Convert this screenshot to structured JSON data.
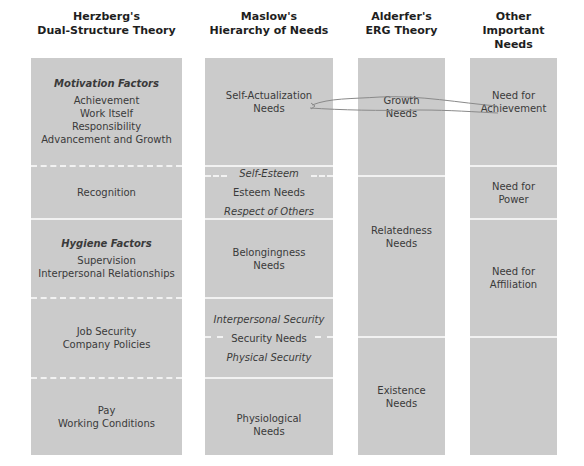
{
  "headers": {
    "herzberg": [
      "Herzberg's",
      "Dual-Structure Theory"
    ],
    "maslow": [
      "Maslow's",
      "Hierarchy of Needs"
    ],
    "alderfer": [
      "Alderfer's",
      "ERG Theory"
    ],
    "other": [
      "Other",
      "Important Needs"
    ]
  },
  "herzberg": {
    "motivation_heading": "Motivation Factors",
    "motivation_items": [
      "Achievement",
      "Work Itself",
      "Responsibility",
      "Advancement and Growth"
    ],
    "recognition": "Recognition",
    "hygiene_heading": "Hygiene Factors",
    "hygiene_items_1": [
      "Supervision",
      "Interpersonal Relationships"
    ],
    "hygiene_items_2": [
      "Job Security",
      "Company Policies"
    ],
    "hygiene_items_3": [
      "Pay",
      "Working Conditions"
    ]
  },
  "maslow": {
    "self_actualization": [
      "Self-Actualization",
      "Needs"
    ],
    "esteem_upper": "Self-Esteem",
    "esteem_label": "Esteem Needs",
    "esteem_lower": "Respect of Others",
    "belongingness": [
      "Belongingness",
      "Needs"
    ],
    "security_upper": "Interpersonal Security",
    "security_label": "Security Needs",
    "security_lower": "Physical Security",
    "physiological": [
      "Physiological",
      "Needs"
    ]
  },
  "alderfer": {
    "growth": [
      "Growth",
      "Needs"
    ],
    "relatedness": [
      "Relatedness",
      "Needs"
    ],
    "existence": [
      "Existence",
      "Needs"
    ]
  },
  "other": {
    "achievement": [
      "Need for",
      "Achievement"
    ],
    "power": [
      "Need for",
      "Power"
    ],
    "affiliation": [
      "Need for",
      "Affiliation"
    ]
  },
  "colors": {
    "box_fill": "#cbcbcb",
    "divider": "#f2f2f2",
    "annotation_stroke": "#8a8a8a"
  }
}
